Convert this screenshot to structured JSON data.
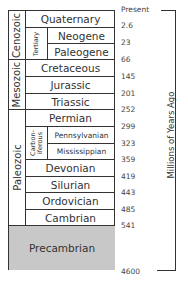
{
  "diagram": {
    "type": "geologic-timescale",
    "axis_label": "Millions of Years Ago",
    "top_label": "Present",
    "eras": [
      {
        "name": "Cenozoic"
      },
      {
        "name": "Mesozoic"
      },
      {
        "name": "Paleozoic"
      }
    ],
    "subgroups": [
      {
        "name": "Tertiary"
      },
      {
        "name": "Carbon-\niferous",
        "line1": "Carbon-",
        "line2": "iferous"
      }
    ],
    "periods": [
      {
        "name": "Quaternary"
      },
      {
        "name": "Neogene"
      },
      {
        "name": "Paleogene"
      },
      {
        "name": "Cretaceous"
      },
      {
        "name": "Jurassic"
      },
      {
        "name": "Triassic"
      },
      {
        "name": "Permian"
      },
      {
        "name": "Pennsylvanian"
      },
      {
        "name": "Mississippian"
      },
      {
        "name": "Devonian"
      },
      {
        "name": "Silurian"
      },
      {
        "name": "Ordovician"
      },
      {
        "name": "Cambrian"
      },
      {
        "name": "Precambrian"
      }
    ],
    "boundaries": [
      "Present",
      "2.6",
      "23",
      "66",
      "145",
      "201",
      "252",
      "299",
      "323",
      "359",
      "419",
      "443",
      "485",
      "541",
      "4600"
    ],
    "colors": {
      "precambrian_fill": "#c8c8c8",
      "line": "#333333"
    }
  }
}
